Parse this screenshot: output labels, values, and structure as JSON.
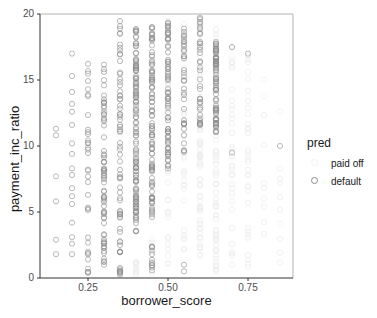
{
  "chart_data": {
    "type": "scatter",
    "title": "",
    "xlabel": "borrower_score",
    "ylabel": "payment_inc_ratio",
    "xlim": [
      0.1,
      0.89
    ],
    "ylim": [
      0,
      20
    ],
    "x_ticks": [
      "0.25",
      "0.50",
      "0.75"
    ],
    "x_tick_values": [
      0.25,
      0.5,
      0.75
    ],
    "y_ticks": [
      "0",
      "5",
      "10",
      "15",
      "20"
    ],
    "y_tick_values": [
      0,
      5,
      10,
      15,
      20
    ],
    "grid": false,
    "legend": {
      "title": "pred",
      "position": "right",
      "entries": [
        {
          "label": "paid off",
          "color": "#f0f0f0"
        },
        {
          "label": "default",
          "color": "#8c8c8c"
        }
      ]
    },
    "series": [
      {
        "name": "paid off",
        "color": "#ececec",
        "marker": "open-circle",
        "columns": [
          {
            "x": 0.6,
            "y_range": [
              0.8,
              19.8
            ],
            "density": "dense"
          },
          {
            "x": 0.65,
            "y_range": [
              0.5,
              19.0
            ],
            "density": "dense"
          },
          {
            "x": 0.7,
            "y_range": [
              0.5,
              18.0
            ],
            "density": "medium"
          },
          {
            "x": 0.75,
            "y_range": [
              0.5,
              17.0
            ],
            "density": "medium"
          },
          {
            "x": 0.8,
            "y_range": [
              0.5,
              16.5
            ],
            "density": "sparse"
          },
          {
            "x": 0.85,
            "y_range": [
              0.8,
              14.0
            ],
            "density": "sparse"
          },
          {
            "x": 0.5,
            "y_range": [
              0.5,
              20.0
            ],
            "density": "medium"
          },
          {
            "x": 0.55,
            "y_range": [
              0.5,
              20.0
            ],
            "density": "medium"
          },
          {
            "x": 0.45,
            "y_range": [
              0.2,
              3.0
            ],
            "density": "sparse"
          },
          {
            "x": 0.4,
            "y_range": [
              0.2,
              2.0
            ],
            "density": "sparse"
          }
        ]
      },
      {
        "name": "default",
        "color": "#8c8c8c",
        "marker": "open-circle",
        "columns": [
          {
            "x": 0.15,
            "y": [
              1.8,
              2.9,
              5.8,
              7.7,
              10.8,
              11.3
            ]
          },
          {
            "x": 0.2,
            "y": [
              1.8,
              2.6,
              3.1,
              4.2,
              5.6,
              6.2,
              6.8,
              7.8,
              8.3,
              9.4,
              10.2,
              11.6,
              12.6,
              13.2,
              14.1,
              15.3,
              17.0
            ]
          },
          {
            "x": 0.25,
            "y_range": [
              0.4,
              16.3
            ],
            "density": "medium"
          },
          {
            "x": 0.3,
            "y_range": [
              1.0,
              16.7
            ],
            "density": "dense"
          },
          {
            "x": 0.35,
            "y_range": [
              0.2,
              19.5
            ],
            "density": "dense"
          },
          {
            "x": 0.4,
            "y_range": [
              3.5,
              19.0
            ],
            "density": "very-dense",
            "gap_below": 3.5
          },
          {
            "x": 0.45,
            "y_range": [
              0.5,
              19.5
            ],
            "density": "very-dense",
            "gap": [
              2.5,
              4.2
            ]
          },
          {
            "x": 0.5,
            "y_range": [
              8.2,
              19.5
            ],
            "density": "dense"
          },
          {
            "x": 0.55,
            "y_range": [
              9.5,
              19.0
            ],
            "density": "medium",
            "extra": [
              0.5,
              1.0
            ]
          },
          {
            "x": 0.6,
            "y_range": [
              11.5,
              19.8
            ],
            "density": "medium"
          },
          {
            "x": 0.65,
            "y_range": [
              11.0,
              18.0
            ],
            "density": "dense"
          },
          {
            "x": 0.7,
            "y": [
              9.5,
              17.5
            ]
          },
          {
            "x": 0.75,
            "y": [
              17.0
            ]
          },
          {
            "x": 0.85,
            "y": [
              10.0
            ]
          }
        ]
      }
    ]
  },
  "plot": {
    "background": "#ffffff",
    "axis_color": "#b3b3b3",
    "tick_label_color": "#4d4d4d"
  }
}
